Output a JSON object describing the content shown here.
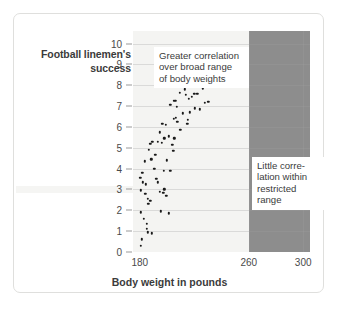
{
  "chart_data": {
    "type": "scatter",
    "title": "",
    "xlabel": "Body weight in pounds",
    "ylabel": "Football linemen's success",
    "ylabel_lines": [
      "Football linemen's",
      "success"
    ],
    "xlim": [
      175,
      305
    ],
    "ylim": [
      0,
      10.6
    ],
    "xticks": [
      180,
      260,
      300
    ],
    "xtick_labels": [
      "180",
      "260",
      "300"
    ],
    "yticks": [
      0,
      1,
      2,
      3,
      4,
      5,
      6,
      7,
      8,
      9,
      10
    ],
    "ytick_labels": [
      "0",
      "1",
      "2",
      "3",
      "4",
      "5",
      "6",
      "7",
      "8",
      "9",
      "10"
    ],
    "grid": "horizontal",
    "legend": "none",
    "shaded_region": {
      "label": "restricted range",
      "x_start": 260,
      "x_end": 305,
      "color": "#8d8d8d"
    },
    "plot_background": "#f4f4f2",
    "point_color": "#1a1a1a",
    "annotations": [
      {
        "name": "broad-range-note",
        "lines": [
          "Greater correlation",
          "over broad range",
          "of body weights"
        ],
        "text": "Greater correlation over broad range of body weights"
      },
      {
        "name": "restricted-range-note",
        "lines": [
          "Little corre-",
          "lation within",
          "restricted",
          "range"
        ],
        "text": "Little correlation within restricted range"
      }
    ],
    "points": [
      [
        180.6,
        0.3
      ],
      [
        181.6,
        0.6
      ],
      [
        180.8,
        1.9
      ],
      [
        182.8,
        1.6
      ],
      [
        185.3,
        1.1
      ],
      [
        186.0,
        0.95
      ],
      [
        185.2,
        1.35
      ],
      [
        188.6,
        0.9
      ],
      [
        180.3,
        3.55
      ],
      [
        180.8,
        2.95
      ],
      [
        181.8,
        3.8
      ],
      [
        182.4,
        3.35
      ],
      [
        183.9,
        2.8
      ],
      [
        184.6,
        3.25
      ],
      [
        186.0,
        2.55
      ],
      [
        186.3,
        2.3
      ],
      [
        187.8,
        2.45
      ],
      [
        183.6,
        4.35
      ],
      [
        186.4,
        4.9
      ],
      [
        187.7,
        5.2
      ],
      [
        189.1,
        5.3
      ],
      [
        188.4,
        4.45
      ],
      [
        190.6,
        4.0
      ],
      [
        191.4,
        4.65
      ],
      [
        193.2,
        5.3
      ],
      [
        192.2,
        3.5
      ],
      [
        193.0,
        3.35
      ],
      [
        194.5,
        2.9
      ],
      [
        195.2,
        1.95
      ],
      [
        197.4,
        2.85
      ],
      [
        198.0,
        3.0
      ],
      [
        199.4,
        2.7
      ],
      [
        201.3,
        1.85
      ],
      [
        197.5,
        3.9
      ],
      [
        199.9,
        4.4
      ],
      [
        202.3,
        3.9
      ],
      [
        196.3,
        5.25
      ],
      [
        198.1,
        5.45
      ],
      [
        201.1,
        5.55
      ],
      [
        203.8,
        5.15
      ],
      [
        205.4,
        5.45
      ],
      [
        204.6,
        4.85
      ],
      [
        196.4,
        6.15
      ],
      [
        199.1,
        6.1
      ],
      [
        194.9,
        5.75
      ],
      [
        207.5,
        6.25
      ],
      [
        209.8,
        5.85
      ],
      [
        205.0,
        6.4
      ],
      [
        202.5,
        7.05
      ],
      [
        204.8,
        7.25
      ],
      [
        206.2,
        7.25
      ],
      [
        207.1,
        6.95
      ],
      [
        209.4,
        7.65
      ],
      [
        211.0,
        8.1
      ],
      [
        206.4,
        6.45
      ],
      [
        211.8,
        6.65
      ],
      [
        213.9,
        7.55
      ],
      [
        214.9,
        6.15
      ],
      [
        215.3,
        6.35
      ],
      [
        213.2,
        7.8
      ],
      [
        216.6,
        6.7
      ],
      [
        218.4,
        7.45
      ],
      [
        222.1,
        7.6
      ],
      [
        220.4,
        6.9
      ],
      [
        224.2,
        6.85
      ],
      [
        213.6,
        8.95
      ],
      [
        217.1,
        9.3
      ],
      [
        218.9,
        8.6
      ],
      [
        222.5,
        8.6
      ],
      [
        226.1,
        9.25
      ],
      [
        228.5,
        9.25
      ],
      [
        230.9,
        9.1
      ],
      [
        226.4,
        7.85
      ],
      [
        231.7,
        8.4
      ],
      [
        227.8,
        7.15
      ],
      [
        230.2,
        7.2
      ],
      [
        220.0,
        7.6
      ],
      [
        215.9,
        7.35
      ]
    ]
  }
}
